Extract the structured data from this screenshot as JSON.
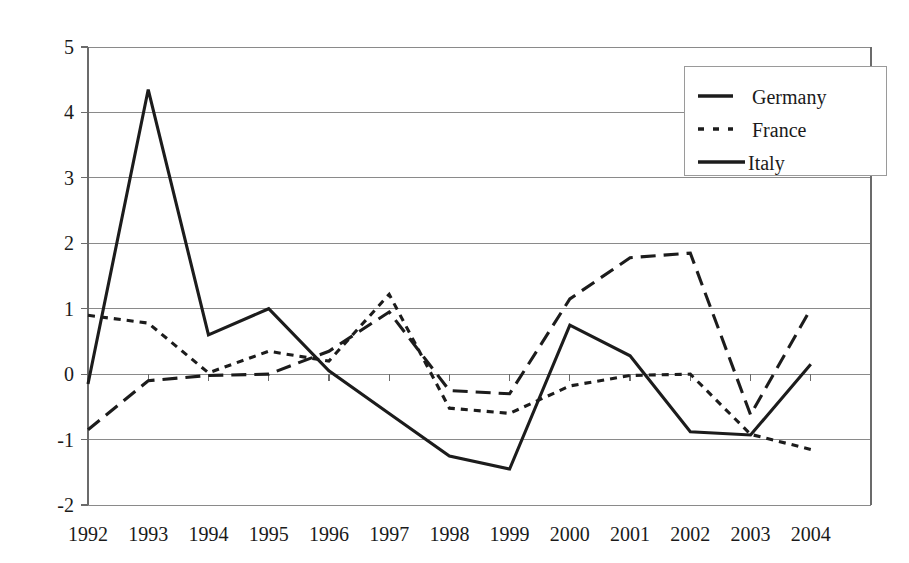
{
  "chart_data": {
    "type": "line",
    "title": "",
    "subtitle": "",
    "xlabel": "",
    "ylabel": "",
    "categories": [
      "1992",
      "1993",
      "1994",
      "1995",
      "1996",
      "1997",
      "1998",
      "1999",
      "2000",
      "2001",
      "2002",
      "2003",
      "2004"
    ],
    "ylim": [
      -2,
      5
    ],
    "yticks": [
      "5",
      "4",
      "3",
      "2",
      "1",
      "0",
      "-1",
      "-2"
    ],
    "ytick_values": [
      5,
      4,
      3,
      2,
      1,
      0,
      -1,
      -2
    ],
    "grid": true,
    "legend_position": "top-right",
    "series": [
      {
        "name": "Germany",
        "style": "long-dash",
        "values": [
          -0.85,
          -0.1,
          -0.02,
          0.0,
          0.35,
          0.95,
          -0.25,
          -0.3,
          1.15,
          1.78,
          1.85,
          -0.62,
          1.0
        ]
      },
      {
        "name": "France",
        "style": "short-dash",
        "values": [
          0.9,
          0.78,
          0.02,
          0.35,
          0.2,
          1.22,
          -0.52,
          -0.6,
          -0.18,
          -0.02,
          0.0,
          -0.92,
          -1.15
        ]
      },
      {
        "name": "Italy",
        "style": "solid",
        "values": [
          -0.15,
          4.35,
          0.6,
          1.0,
          0.05,
          -0.6,
          -1.25,
          -1.45,
          0.75,
          0.28,
          -0.88,
          -0.93,
          0.15
        ]
      }
    ]
  },
  "legend": {
    "entries": [
      {
        "label": "Germany",
        "style": "long-dash"
      },
      {
        "label": "France",
        "style": "short-dash"
      },
      {
        "label": "Italy",
        "style": "solid"
      }
    ]
  },
  "axes": {
    "y_ticks": [
      {
        "label": "5",
        "value": 5
      },
      {
        "label": "4",
        "value": 4
      },
      {
        "label": "3",
        "value": 3
      },
      {
        "label": "2",
        "value": 2
      },
      {
        "label": "1",
        "value": 1
      },
      {
        "label": "0",
        "value": 0
      },
      {
        "label": "-1",
        "value": -1
      },
      {
        "label": "-2",
        "value": -2
      }
    ],
    "x_ticks": [
      {
        "label": "1992"
      },
      {
        "label": "1993"
      },
      {
        "label": "1994"
      },
      {
        "label": "1995"
      },
      {
        "label": "1996"
      },
      {
        "label": "1997"
      },
      {
        "label": "1998"
      },
      {
        "label": "1999"
      },
      {
        "label": "2000"
      },
      {
        "label": "2001"
      },
      {
        "label": "2002"
      },
      {
        "label": "2003"
      },
      {
        "label": "2004"
      }
    ]
  },
  "colors": {
    "line": "#1c1c1c",
    "grid": "#8a8a8a",
    "axis": "#6b6b6b",
    "text": "#1a1a1a",
    "background": "#ffffff"
  }
}
